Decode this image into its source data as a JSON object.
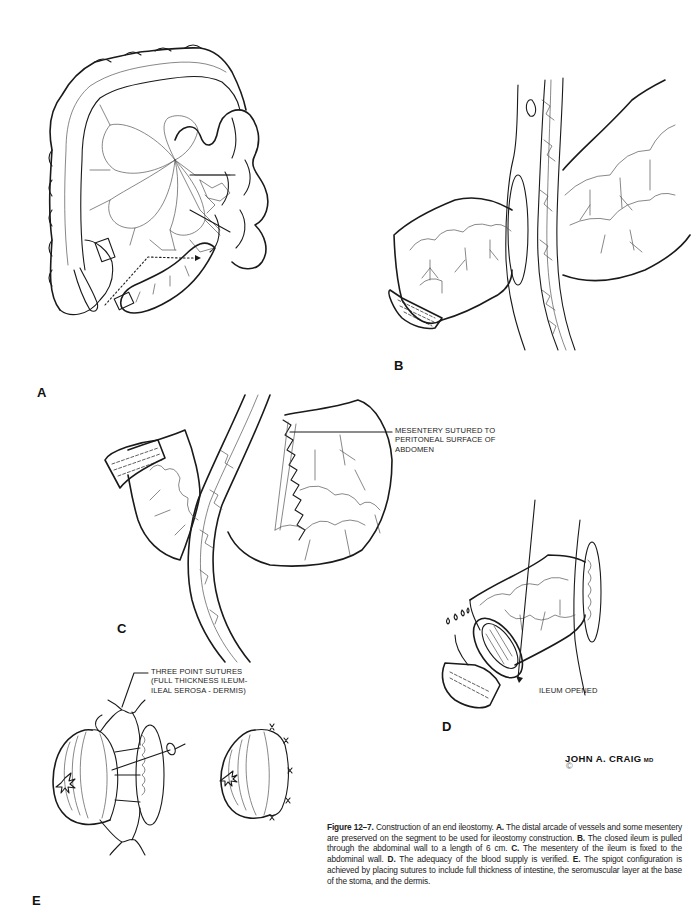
{
  "figure": {
    "number": "Figure 12–7.",
    "title_text": "Construction of an end ileostomy.",
    "panels": [
      {
        "label": "A",
        "caption": "The distal arcade of vessels and some mesentery are preserved on the segment to be used for ileostomy construction."
      },
      {
        "label": "B",
        "caption": "The closed ileum is pulled through the abdominal wall to a length of 6 cm."
      },
      {
        "label": "C",
        "caption": "The mesentery of the ileum is fixed to the abdominal wall."
      },
      {
        "label": "D",
        "caption": "The adequacy of the blood supply is verified."
      },
      {
        "label": "E",
        "caption": "The spigot configuration is achieved by placing sutures to include full thickness of intestine, the seromuscular layer at the base of the stoma, and the dermis."
      }
    ]
  },
  "annotations": {
    "panel_c": [
      "MESENTERY SUTURED TO",
      "PERITONEAL SURFACE OF",
      "ABDOMEN"
    ],
    "panel_d": [
      "ILEUM OPENED"
    ],
    "panel_e": [
      "THREE POINT SUTURES",
      "(FULL THICKNESS ILEUM-",
      "ILEAL SEROSA - DERMIS)"
    ]
  },
  "signature": {
    "artist": "JOHN A. CRAIG",
    "suffix": "MD",
    "copyright_symbol": "©"
  },
  "illustrations": [
    {
      "panel": "A",
      "subject": "colon-and-small-bowel-with-mesenteric-arcades"
    },
    {
      "panel": "B",
      "subject": "closed-ileum-through-abdominal-wall"
    },
    {
      "panel": "C",
      "subject": "mesentery-sutured-to-peritoneum"
    },
    {
      "panel": "D",
      "subject": "ileum-opened-stoma"
    },
    {
      "panel": "E",
      "subject": "spigot-stoma-three-point-sutures"
    }
  ]
}
